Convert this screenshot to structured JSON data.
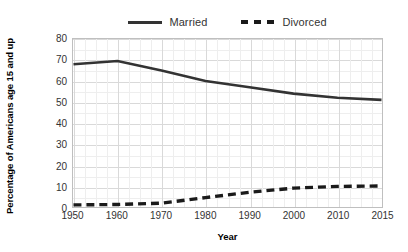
{
  "chart_data": {
    "type": "line",
    "title": "",
    "xlabel": "Year",
    "ylabel": "Percentage of Americans age 15 and up",
    "categories": [
      "1950",
      "1960",
      "1970",
      "1980",
      "1990",
      "2000",
      "2010",
      "2015"
    ],
    "x": [
      1950,
      1960,
      1970,
      1980,
      1990,
      2000,
      2010,
      2015
    ],
    "series": [
      {
        "name": "Married",
        "style": "solid",
        "color": "#333333",
        "values": [
          68,
          69.5,
          65,
          60,
          57,
          54,
          52,
          51
        ]
      },
      {
        "name": "Divorced",
        "style": "dashed",
        "color": "#1a1a1a",
        "values": [
          1,
          1.2,
          1.8,
          4.5,
          7,
          9,
          9.8,
          10
        ]
      }
    ],
    "ylim": [
      0,
      80
    ],
    "yticks": [
      0,
      10,
      20,
      30,
      40,
      50,
      60,
      70,
      80
    ],
    "ytick_labels": [
      "0",
      "10",
      "20",
      "30",
      "40",
      "50",
      "60",
      "70",
      "80"
    ],
    "grid": true,
    "minor_grid": true,
    "legend_position": "top-center",
    "legend_entries": [
      "Married",
      "Divorced"
    ]
  },
  "axes": {
    "x_title": "Year",
    "y_title": "Percentage of Americans age 15 and up"
  },
  "legend": {
    "married_label": "Married",
    "divorced_label": "Divorced"
  },
  "colors": {
    "married_line": "#333333",
    "divorced_line": "#1a1a1a",
    "grid_major": "#d9d9d9",
    "grid_minor": "#eeeeee",
    "frame": "#bfbfbf",
    "background": "#ffffff",
    "tick_text": "#333333"
  }
}
